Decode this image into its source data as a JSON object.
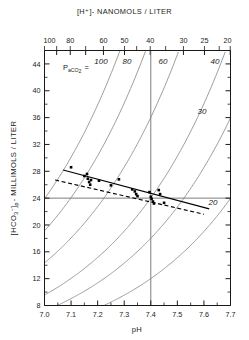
{
  "figure": {
    "top_axis_title": "[H⁺]- NANOMOLS / LITER",
    "x_axis_label": "pH",
    "y_axis_label_parts": {
      "bracket_open": "[HCO",
      "sub3": "3",
      "sup_minus": "−",
      "bracket_close": "]",
      "subp": "p",
      "rest": "- MILLIMOLS / LITER"
    },
    "y_axis_label_plain": "[HCO3−]p - MILLIMOLS / LITER",
    "pco2_label": {
      "p": "P",
      "sub": "aCO",
      "sub2": "2",
      "equals": "="
    },
    "pco2_label_plain": "PaCO2 =",
    "colors": {
      "axis": "#1a1a1a",
      "isobar": "#8a8a8a",
      "reference_line": "#6e6e6e",
      "regression_solid": "#000000",
      "regression_dashed": "#000000",
      "data_point": "#000000",
      "background": "#ffffff"
    }
  },
  "chart_data": {
    "type": "scatter",
    "title": "",
    "xlabel": "pH",
    "ylabel": "[HCO3-]p - MILLIMOLS / LITER",
    "xlim": [
      7.0,
      7.7
    ],
    "ylim": [
      8,
      46
    ],
    "grid": false,
    "legend": "none",
    "x_ticks": [
      7.0,
      7.1,
      7.2,
      7.3,
      7.4,
      7.5,
      7.6,
      7.7
    ],
    "x_tick_labels": [
      "7.0",
      "7.1",
      "7.2",
      "7.3",
      "7.4",
      "7.5",
      "7.6",
      "7.7"
    ],
    "y_ticks": [
      8,
      12,
      16,
      20,
      24,
      28,
      32,
      36,
      40,
      44
    ],
    "y_tick_labels": [
      "8",
      "12",
      "16",
      "20",
      "24",
      "28",
      "32",
      "36",
      "40",
      "44"
    ],
    "y_minor_ticks": [
      10,
      14,
      18,
      22,
      26,
      30,
      34,
      38,
      42
    ],
    "top_axis": {
      "label": "[H⁺]- NANOMOLS / LITER",
      "unit": "nanomols/liter",
      "tick_values": [
        100,
        90,
        80,
        70,
        60,
        50,
        40,
        30,
        25,
        20
      ],
      "labeled_ticks": [
        100,
        80,
        60,
        50,
        40,
        30,
        25,
        20
      ],
      "labeled_tick_text": [
        "100",
        "80",
        "60",
        "50",
        "40",
        "30",
        "25",
        "20"
      ],
      "relation": "pH = 9 - log10([H+])"
    },
    "isobars": {
      "name": "PaCO2 isobars (mm Hg)",
      "values": [
        100,
        80,
        60,
        40,
        30,
        20
      ],
      "labels": [
        "100",
        "80",
        "60",
        "40",
        "30",
        "20"
      ],
      "equation": "HCO3 = 0.0301 * PCO2 * 10^(pH - 6.1)"
    },
    "reference_lines": [
      {
        "name": "normal-ph-line",
        "orientation": "vertical",
        "value": 7.4
      },
      {
        "name": "normal-bicarbonate-line",
        "orientation": "horizontal",
        "value": 24
      }
    ],
    "fit_lines": [
      {
        "name": "solid-regression-line",
        "style": "solid",
        "x": [
          7.07,
          7.62
        ],
        "y": [
          28.2,
          22.4
        ]
      },
      {
        "name": "dashed-regression-line",
        "style": "dashed",
        "x": [
          7.04,
          7.6
        ],
        "y": [
          26.7,
          21.6
        ]
      }
    ],
    "series": [
      {
        "name": "observations",
        "marker": "square",
        "points": [
          [
            7.1,
            28.6
          ],
          [
            7.15,
            27.3
          ],
          [
            7.16,
            27.6
          ],
          [
            7.163,
            26.9
          ],
          [
            7.168,
            26.4
          ],
          [
            7.172,
            26.0
          ],
          [
            7.175,
            26.7
          ],
          [
            7.205,
            26.6
          ],
          [
            7.25,
            25.9
          ],
          [
            7.28,
            26.8
          ],
          [
            7.33,
            25.3
          ],
          [
            7.34,
            25.0
          ],
          [
            7.345,
            24.6
          ],
          [
            7.35,
            24.3
          ],
          [
            7.395,
            24.9
          ],
          [
            7.4,
            24.2
          ],
          [
            7.403,
            23.9
          ],
          [
            7.408,
            23.5
          ],
          [
            7.412,
            23.2
          ],
          [
            7.43,
            25.2
          ],
          [
            7.435,
            24.6
          ],
          [
            7.45,
            23.3
          ]
        ]
      }
    ]
  }
}
